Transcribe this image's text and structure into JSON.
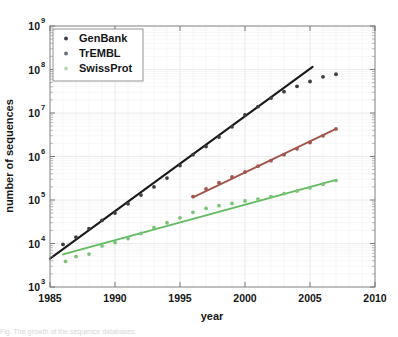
{
  "figure": {
    "background": "#ffffff",
    "caption_partial": "Fig.  The growth of the sequence databases"
  },
  "chart_data": {
    "type": "scatter",
    "title": "",
    "xlabel": "year",
    "ylabel": "number of sequences",
    "xlim": [
      1985,
      2010
    ],
    "ylim_exponent": [
      3,
      9
    ],
    "yscale": "log",
    "grid": true,
    "grid_minor": true,
    "legend_position": "top-left",
    "xticks": [
      1985,
      1990,
      1995,
      2000,
      2005,
      2010
    ],
    "xtick_labels": [
      "1985",
      "1990",
      "1995",
      "2000",
      "2005",
      "2010"
    ],
    "yticks_exponent": [
      3,
      4,
      5,
      6,
      7,
      8,
      9
    ],
    "ytick_mantissa": "10",
    "ytick_labels": [
      "10^3",
      "10^4",
      "10^5",
      "10^6",
      "10^7",
      "10^8",
      "10^9"
    ],
    "colors": {
      "genbank": "#3c3c44",
      "genbank_fit": "#1a1a1a",
      "trembl": "#a0564a",
      "swissprot": "#7ac47a",
      "swissprot_fit": "#62bb62",
      "axis": "#8a8a8a",
      "grid": "#e2e2e2"
    },
    "series": [
      {
        "name": "GenBank",
        "marker": "dot",
        "color": "#3c3c44",
        "fit_color": "#1a1a1a",
        "fit_endpoints": [
          {
            "x": 1985.0,
            "y": 4500
          },
          {
            "x": 2005.2,
            "y": 115000000
          }
        ],
        "points": [
          {
            "x": 1986.0,
            "y": 9500
          },
          {
            "x": 1987.0,
            "y": 14000
          },
          {
            "x": 1988.0,
            "y": 22000
          },
          {
            "x": 1989.0,
            "y": 34000
          },
          {
            "x": 1990.0,
            "y": 50000
          },
          {
            "x": 1991.0,
            "y": 82000
          },
          {
            "x": 1992.0,
            "y": 130000
          },
          {
            "x": 1993.0,
            "y": 200000
          },
          {
            "x": 1994.0,
            "y": 320000
          },
          {
            "x": 1995.0,
            "y": 620000
          },
          {
            "x": 1996.0,
            "y": 1100000
          },
          {
            "x": 1997.0,
            "y": 1700000
          },
          {
            "x": 1998.0,
            "y": 2800000
          },
          {
            "x": 1999.0,
            "y": 4800000
          },
          {
            "x": 2000.0,
            "y": 9000000
          },
          {
            "x": 2001.0,
            "y": 14000000
          },
          {
            "x": 2002.0,
            "y": 22000000
          },
          {
            "x": 2003.0,
            "y": 31000000
          },
          {
            "x": 2004.0,
            "y": 41000000
          },
          {
            "x": 2005.0,
            "y": 53000000
          },
          {
            "x": 2006.0,
            "y": 68000000
          },
          {
            "x": 2007.0,
            "y": 78000000
          }
        ]
      },
      {
        "name": "TrEMBL",
        "marker": "dot",
        "color": "#a0564a",
        "fit_color": "#a0564a",
        "fit_endpoints": [
          {
            "x": 1996.0,
            "y": 115000
          },
          {
            "x": 2007.0,
            "y": 4300000
          }
        ],
        "points": [
          {
            "x": 1996.0,
            "y": 120000
          },
          {
            "x": 1997.0,
            "y": 180000
          },
          {
            "x": 1998.0,
            "y": 250000
          },
          {
            "x": 1999.0,
            "y": 340000
          },
          {
            "x": 2000.0,
            "y": 440000
          },
          {
            "x": 2001.0,
            "y": 600000
          },
          {
            "x": 2002.0,
            "y": 800000
          },
          {
            "x": 2003.0,
            "y": 1100000
          },
          {
            "x": 2004.0,
            "y": 1500000
          },
          {
            "x": 2005.0,
            "y": 2100000
          },
          {
            "x": 2006.0,
            "y": 3000000
          },
          {
            "x": 2007.0,
            "y": 4300000
          }
        ]
      },
      {
        "name": "SwissProt",
        "marker": "dot",
        "color": "#7ac47a",
        "fit_color": "#62bb62",
        "fit_endpoints": [
          {
            "x": 1986.0,
            "y": 5600
          },
          {
            "x": 2007.0,
            "y": 290000
          }
        ],
        "points": [
          {
            "x": 1986.2,
            "y": 3900
          },
          {
            "x": 1987.0,
            "y": 5000
          },
          {
            "x": 1988.0,
            "y": 5700
          },
          {
            "x": 1989.0,
            "y": 8800
          },
          {
            "x": 1990.0,
            "y": 10500
          },
          {
            "x": 1991.0,
            "y": 13000
          },
          {
            "x": 1992.0,
            "y": 17000
          },
          {
            "x": 1993.0,
            "y": 23000
          },
          {
            "x": 1994.0,
            "y": 30000
          },
          {
            "x": 1995.0,
            "y": 39000
          },
          {
            "x": 1996.0,
            "y": 52000
          },
          {
            "x": 1997.0,
            "y": 64000
          },
          {
            "x": 1998.0,
            "y": 74000
          },
          {
            "x": 1999.0,
            "y": 83000
          },
          {
            "x": 2000.0,
            "y": 95000
          },
          {
            "x": 2001.0,
            "y": 105000
          },
          {
            "x": 2002.0,
            "y": 120000
          },
          {
            "x": 2003.0,
            "y": 140000
          },
          {
            "x": 2004.0,
            "y": 160000
          },
          {
            "x": 2005.0,
            "y": 190000
          },
          {
            "x": 2006.0,
            "y": 230000
          },
          {
            "x": 2007.0,
            "y": 280000
          }
        ]
      }
    ],
    "legend": [
      {
        "label": "GenBank",
        "color": "#3c3c44"
      },
      {
        "label": "TrEMBL",
        "color": "#6e6e78"
      },
      {
        "label": "SwissProt",
        "color": "#b6d9b6"
      }
    ]
  }
}
